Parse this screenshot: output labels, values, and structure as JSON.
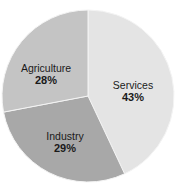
{
  "chart_data": {
    "type": "pie",
    "title": "",
    "start_angle": "12 o'clock, clockwise",
    "slices": [
      {
        "label": "Services",
        "value": 43,
        "value_label": "43%",
        "color": "#e4e4e4"
      },
      {
        "label": "Industry",
        "value": 29,
        "value_label": "29%",
        "color": "#a8a8a8"
      },
      {
        "label": "Agriculture",
        "value": 28,
        "value_label": "28%",
        "color": "#c4c4c4"
      }
    ],
    "legend": "none (labels inside slices)"
  }
}
